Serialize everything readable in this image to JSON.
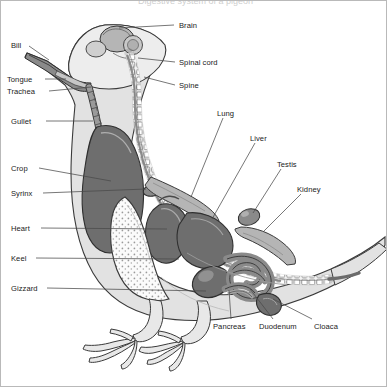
{
  "figure": {
    "title_fragment": "Digestive system of a pigeon",
    "background": "#ffffff",
    "frame_color": "#b9b9b9"
  },
  "palette": {
    "body_fill": "#e2e2e2",
    "body_fill_light": "#ededed",
    "organ_dark": "#6e6e6e",
    "organ_mid": "#8a8a8a",
    "organ_light": "#b5b5b5",
    "bone_fill": "#f2f2f2",
    "outline": "#3a3a3a",
    "keel_stipple": "#fafafa",
    "leader_line": "#4a4a4a"
  },
  "labels": [
    {
      "id": "brain",
      "text": "Brain",
      "side": "right",
      "x": 178,
      "y": 20,
      "lx1": 173,
      "ly1": 24,
      "lx2": 118,
      "ly2": 27
    },
    {
      "id": "bill",
      "text": "Bill",
      "side": "left",
      "x": 10,
      "y": 40,
      "lx1": 28,
      "ly1": 45,
      "lx2": 48,
      "ly2": 59
    },
    {
      "id": "tongue",
      "text": "Tongue",
      "side": "left",
      "x": 6,
      "y": 74,
      "lx1": 44,
      "ly1": 78,
      "lx2": 65,
      "ly2": 78
    },
    {
      "id": "trachea",
      "text": "Trachea",
      "side": "left",
      "x": 6,
      "y": 86,
      "lx1": 48,
      "ly1": 90,
      "lx2": 90,
      "ly2": 86
    },
    {
      "id": "spinal-cord",
      "text": "Spinal cord",
      "side": "right",
      "x": 178,
      "y": 57,
      "lx1": 174,
      "ly1": 61,
      "lx2": 137,
      "ly2": 57
    },
    {
      "id": "spine",
      "text": "Spine",
      "side": "right",
      "x": 178,
      "y": 80,
      "lx1": 174,
      "ly1": 84,
      "lx2": 143,
      "ly2": 76
    },
    {
      "id": "gullet",
      "text": "Gullet",
      "side": "left",
      "x": 10,
      "y": 116,
      "lx1": 45,
      "ly1": 120,
      "lx2": 92,
      "ly2": 120
    },
    {
      "id": "lung",
      "text": "Lung",
      "side": "right",
      "x": 216,
      "y": 108,
      "lx1": 222,
      "ly1": 117,
      "lx2": 190,
      "ly2": 196
    },
    {
      "id": "liver",
      "text": "Liver",
      "side": "right",
      "x": 249,
      "y": 133,
      "lx1": 254,
      "ly1": 142,
      "lx2": 211,
      "ly2": 218
    },
    {
      "id": "crop",
      "text": "Crop",
      "side": "left",
      "x": 10,
      "y": 163,
      "lx1": 38,
      "ly1": 167,
      "lx2": 110,
      "ly2": 180
    },
    {
      "id": "testis",
      "text": "Testis",
      "side": "right",
      "x": 276,
      "y": 159,
      "lx1": 280,
      "ly1": 168,
      "lx2": 252,
      "ly2": 212
    },
    {
      "id": "syrinx",
      "text": "Syrinx",
      "side": "left",
      "x": 10,
      "y": 188,
      "lx1": 42,
      "ly1": 192,
      "lx2": 145,
      "ly2": 188
    },
    {
      "id": "kidney",
      "text": "Kidney",
      "side": "right",
      "x": 296,
      "y": 184,
      "lx1": 300,
      "ly1": 193,
      "lx2": 262,
      "ly2": 231
    },
    {
      "id": "heart",
      "text": "Heart",
      "side": "left",
      "x": 10,
      "y": 223,
      "lx1": 40,
      "ly1": 227,
      "lx2": 166,
      "ly2": 228
    },
    {
      "id": "keel",
      "text": "Keel",
      "side": "left",
      "x": 10,
      "y": 253,
      "lx1": 35,
      "ly1": 257,
      "lx2": 178,
      "ly2": 258
    },
    {
      "id": "gizzard",
      "text": "Gizzard",
      "side": "left",
      "x": 10,
      "y": 283,
      "lx1": 46,
      "ly1": 287,
      "lx2": 205,
      "ly2": 290
    },
    {
      "id": "pancreas",
      "text": "Pancreas",
      "side": "below",
      "x": 212,
      "y": 321,
      "lx1": 230,
      "ly1": 318,
      "lx2": 228,
      "ly2": 289
    },
    {
      "id": "duodenum",
      "text": "Duodenum",
      "side": "below",
      "x": 258,
      "y": 321,
      "lx1": 272,
      "ly1": 318,
      "lx2": 249,
      "ly2": 288
    },
    {
      "id": "cloaca",
      "text": "Cloaca",
      "side": "below",
      "x": 313,
      "y": 321,
      "lx1": 311,
      "ly1": 318,
      "lx2": 272,
      "ly2": 298
    }
  ],
  "organs": [
    {
      "id": "brain",
      "name": "Brain",
      "tone": "organ_light"
    },
    {
      "id": "spinal-cord",
      "name": "Spinal cord",
      "tone": "organ_mid"
    },
    {
      "id": "spine",
      "name": "Spine",
      "tone": "bone_fill"
    },
    {
      "id": "bill",
      "name": "Bill",
      "tone": "organ_mid"
    },
    {
      "id": "tongue",
      "name": "Tongue",
      "tone": "organ_light"
    },
    {
      "id": "trachea",
      "name": "Trachea",
      "tone": "organ_mid"
    },
    {
      "id": "gullet",
      "name": "Gullet",
      "tone": "organ_mid"
    },
    {
      "id": "crop",
      "name": "Crop",
      "tone": "organ_dark"
    },
    {
      "id": "syrinx",
      "name": "Syrinx",
      "tone": "organ_mid"
    },
    {
      "id": "lung",
      "name": "Lung",
      "tone": "organ_light"
    },
    {
      "id": "heart",
      "name": "Heart",
      "tone": "organ_dark"
    },
    {
      "id": "liver",
      "name": "Liver",
      "tone": "organ_dark"
    },
    {
      "id": "keel",
      "name": "Keel",
      "tone": "keel_stipple"
    },
    {
      "id": "gizzard",
      "name": "Gizzard",
      "tone": "organ_dark"
    },
    {
      "id": "testis",
      "name": "Testis",
      "tone": "organ_mid"
    },
    {
      "id": "kidney",
      "name": "Kidney",
      "tone": "organ_light"
    },
    {
      "id": "pancreas",
      "name": "Pancreas",
      "tone": "organ_mid"
    },
    {
      "id": "duodenum",
      "name": "Duodenum",
      "tone": "organ_mid"
    },
    {
      "id": "intestine",
      "name": "Intestine",
      "tone": "organ_mid"
    },
    {
      "id": "cloaca",
      "name": "Cloaca",
      "tone": "organ_dark"
    }
  ]
}
